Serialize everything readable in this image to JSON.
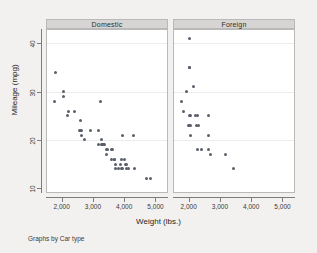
{
  "chart_data": {
    "type": "scatter",
    "title": "",
    "xlabel": "Weight (lbs.)",
    "ylabel": "Mileage (mpg)",
    "note": "Graphs by Car type",
    "facet_variable": "Car type",
    "xlim": [
      1500,
      5400
    ],
    "ylim": [
      9,
      43
    ],
    "xticks": [
      2000,
      3000,
      4000,
      5000
    ],
    "xtick_labels": [
      "2,000",
      "3,000",
      "4,000",
      "5,000"
    ],
    "yticks": [
      10,
      20,
      30,
      40
    ],
    "ytick_labels": [
      "10",
      "20",
      "30",
      "40"
    ],
    "grid": "horizontal",
    "legend": "none",
    "marker_color": "#595f6b",
    "panel_header_color": "#d6d5d3",
    "background_color": "#f2f1ef",
    "plot_background_color": "#ffffff",
    "panels": [
      {
        "label": "Domestic",
        "points": [
          [
            1800,
            34
          ],
          [
            1760,
            28
          ],
          [
            2070,
            30
          ],
          [
            2050,
            29
          ],
          [
            2230,
            26
          ],
          [
            2200,
            25
          ],
          [
            2410,
            26
          ],
          [
            2600,
            24
          ],
          [
            2580,
            22
          ],
          [
            2600,
            22
          ],
          [
            2640,
            22
          ],
          [
            2630,
            21
          ],
          [
            2730,
            20
          ],
          [
            2930,
            22
          ],
          [
            3180,
            22
          ],
          [
            3250,
            28
          ],
          [
            3170,
            19
          ],
          [
            3260,
            20
          ],
          [
            3280,
            19
          ],
          [
            3300,
            19
          ],
          [
            3330,
            19
          ],
          [
            3350,
            19
          ],
          [
            3370,
            19
          ],
          [
            3420,
            18
          ],
          [
            3470,
            18
          ],
          [
            3600,
            18
          ],
          [
            3640,
            18
          ],
          [
            3420,
            17
          ],
          [
            3600,
            16
          ],
          [
            3690,
            16
          ],
          [
            3700,
            16
          ],
          [
            3900,
            16
          ],
          [
            4000,
            16
          ],
          [
            3720,
            15
          ],
          [
            3880,
            15
          ],
          [
            4030,
            15
          ],
          [
            4060,
            15
          ],
          [
            3730,
            14
          ],
          [
            3830,
            14
          ],
          [
            3900,
            14
          ],
          [
            3960,
            14
          ],
          [
            4060,
            14
          ],
          [
            4130,
            14
          ],
          [
            4330,
            14
          ],
          [
            3960,
            21
          ],
          [
            4290,
            21
          ],
          [
            4720,
            12
          ],
          [
            4840,
            12
          ]
        ]
      },
      {
        "label": "Foreign",
        "points": [
          [
            2020,
            41
          ],
          [
            2020,
            35
          ],
          [
            2040,
            35
          ],
          [
            1930,
            30
          ],
          [
            2160,
            31
          ],
          [
            1760,
            28
          ],
          [
            1830,
            26
          ],
          [
            2020,
            25
          ],
          [
            2050,
            25
          ],
          [
            2230,
            25
          ],
          [
            2280,
            25
          ],
          [
            2650,
            25
          ],
          [
            1990,
            23
          ],
          [
            2040,
            23
          ],
          [
            2070,
            23
          ],
          [
            2240,
            23
          ],
          [
            2320,
            23
          ],
          [
            2070,
            21
          ],
          [
            2650,
            21
          ],
          [
            2280,
            18
          ],
          [
            2400,
            18
          ],
          [
            2650,
            18
          ],
          [
            2690,
            17
          ],
          [
            3170,
            17
          ],
          [
            3420,
            14
          ]
        ]
      }
    ]
  }
}
